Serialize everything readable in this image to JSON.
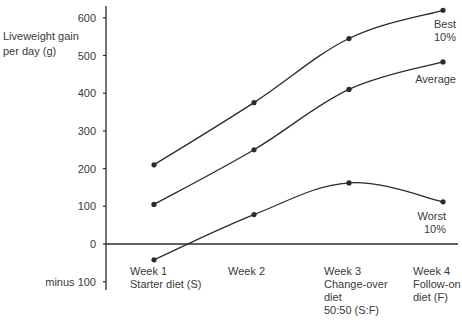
{
  "chart_data": {
    "type": "line",
    "title": "",
    "ylabel": "Liveweight gain per day (g)",
    "xlabel": "",
    "ylim": [
      -100,
      620
    ],
    "grid": false,
    "legend_position": "inline labels at right end of lines",
    "y_ticks": [
      {
        "value": 600,
        "label": "600"
      },
      {
        "value": 500,
        "label": "500"
      },
      {
        "value": 400,
        "label": "400"
      },
      {
        "value": 300,
        "label": "300"
      },
      {
        "value": 200,
        "label": "200"
      },
      {
        "value": 100,
        "label": "100"
      },
      {
        "value": 0,
        "label": "0"
      },
      {
        "value": -100,
        "label": "minus 100"
      }
    ],
    "categories": [
      [
        "Week 1",
        "Starter diet (S)"
      ],
      [
        "Week 2"
      ],
      [
        "Week 3",
        "Change-over",
        "diet",
        "50:50 (S:F)"
      ],
      [
        "Week 4",
        "Follow-on",
        "diet (F)"
      ]
    ],
    "series": [
      {
        "name": "Best 10%",
        "label_lines": [
          "Best",
          "10%"
        ],
        "values": [
          210,
          375,
          545,
          620
        ]
      },
      {
        "name": "Average",
        "label_lines": [
          "Average"
        ],
        "values": [
          105,
          250,
          410,
          483
        ]
      },
      {
        "name": "Worst 10%",
        "label_lines": [
          "Worst",
          "10%"
        ],
        "values": [
          -42,
          78,
          162,
          112
        ]
      }
    ]
  },
  "axis": {
    "ylabel_lines": [
      "Liveweight gain",
      "per day (g)"
    ]
  },
  "colors": {
    "line": "#2b2b2b",
    "text": "#3a3a3a"
  }
}
